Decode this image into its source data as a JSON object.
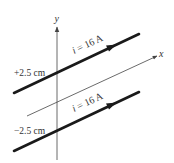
{
  "diagram": {
    "axes": {
      "x_label": "x",
      "y_label": "y"
    },
    "wires": [
      {
        "position_label": "+2.5 cm",
        "current_symbol": "i",
        "current_text": " = 16 A",
        "start": [
          14,
          93
        ],
        "end": [
          139,
          34
        ]
      },
      {
        "position_label": "−2.5 cm",
        "current_symbol": "i",
        "current_text": " = 16 A",
        "start": [
          14,
          151
        ],
        "end": [
          139,
          92
        ]
      }
    ],
    "colors": {
      "wire": "#1a1a1a",
      "axis": "#555555",
      "text": "#333333",
      "background": "#ffffff"
    }
  }
}
